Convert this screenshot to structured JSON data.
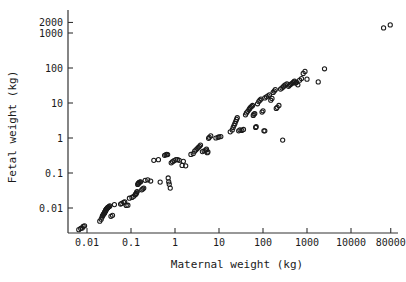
{
  "chart_data": {
    "type": "scatter",
    "title": "",
    "xlabel": "Maternal weight (kg)",
    "ylabel": "Fetal weight (kg)",
    "xscale": "log",
    "yscale": "log",
    "xlim": [
      0.005,
      100000
    ],
    "ylim": [
      0.0018,
      2600
    ],
    "grid": false,
    "legend": null,
    "marker": "open-circle",
    "marker_color": "#1a1a1a",
    "xticks": [
      0.01,
      0.1,
      1,
      10,
      100,
      1000,
      10000,
      80000
    ],
    "xticklabels": [
      "0.01",
      "0.1",
      "1",
      "10",
      "100",
      "1000",
      "10000",
      "80000"
    ],
    "yticks": [
      0.01,
      0.1,
      1,
      10,
      100,
      1000,
      2000
    ],
    "yticklabels": [
      "0.01",
      "0.1",
      "1",
      "10",
      "100",
      "1000",
      "2000"
    ],
    "series": [
      {
        "name": "mammals",
        "x": [
          0.0065,
          0.0072,
          0.0078,
          0.0082,
          0.0088,
          0.0195,
          0.021,
          0.022,
          0.0225,
          0.023,
          0.0235,
          0.024,
          0.0245,
          0.025,
          0.0252,
          0.0255,
          0.026,
          0.0262,
          0.0265,
          0.027,
          0.0272,
          0.0275,
          0.028,
          0.0285,
          0.029,
          0.0295,
          0.03,
          0.031,
          0.032,
          0.033,
          0.035,
          0.038,
          0.042,
          0.058,
          0.062,
          0.068,
          0.072,
          0.078,
          0.085,
          0.092,
          0.105,
          0.115,
          0.125,
          0.128,
          0.132,
          0.135,
          0.138,
          0.142,
          0.145,
          0.148,
          0.152,
          0.158,
          0.165,
          0.175,
          0.185,
          0.195,
          0.21,
          0.24,
          0.28,
          0.33,
          0.42,
          0.46,
          0.58,
          0.62,
          0.65,
          0.68,
          0.7,
          0.72,
          0.74,
          0.78,
          0.82,
          0.88,
          0.95,
          1.05,
          1.15,
          1.25,
          1.45,
          1.55,
          1.75,
          2.3,
          2.6,
          2.8,
          3.0,
          3.2,
          3.4,
          3.6,
          3.8,
          4.2,
          4.6,
          5.0,
          5.2,
          5.4,
          5.6,
          5.8,
          6.0,
          6.5,
          8.5,
          9.5,
          10.0,
          11.0,
          18.0,
          20.0,
          21.0,
          22.0,
          23.0,
          24.0,
          25.0,
          26.0,
          28.0,
          30.0,
          33.0,
          36.0,
          40.0,
          42.0,
          45.0,
          48.0,
          50.0,
          52.0,
          55.0,
          58.0,
          60.0,
          62.0,
          65.0,
          68.0,
          70.0,
          75.0,
          80.0,
          85.0,
          90.0,
          95.0,
          100.0,
          105.0,
          110.0,
          120.0,
          130.0,
          140.0,
          150.0,
          160.0,
          170.0,
          180.0,
          190.0,
          200.0,
          210.0,
          230.0,
          250.0,
          270.0,
          290.0,
          300.0,
          320.0,
          350.0,
          380.0,
          400.0,
          420.0,
          450.0,
          480.0,
          500.0,
          520.0,
          550.0,
          580.0,
          620.0,
          680.0,
          750.0,
          820.0,
          900.0,
          1000.0,
          1800.0,
          2500.0,
          280.0,
          110.0,
          55000.0,
          78000.0
        ],
        "y": [
          0.0024,
          0.0026,
          0.0027,
          0.003,
          0.0031,
          0.0042,
          0.0048,
          0.0055,
          0.006,
          0.0062,
          0.0065,
          0.0068,
          0.007,
          0.0072,
          0.0075,
          0.0078,
          0.008,
          0.0082,
          0.0085,
          0.0088,
          0.009,
          0.0092,
          0.0095,
          0.0098,
          0.01,
          0.0102,
          0.0105,
          0.0108,
          0.011,
          0.0115,
          0.0058,
          0.0062,
          0.0125,
          0.013,
          0.0135,
          0.0145,
          0.015,
          0.0118,
          0.012,
          0.019,
          0.02,
          0.0215,
          0.024,
          0.025,
          0.026,
          0.0285,
          0.0295,
          0.047,
          0.049,
          0.051,
          0.053,
          0.055,
          0.056,
          0.033,
          0.035,
          0.037,
          0.062,
          0.064,
          0.059,
          0.23,
          0.24,
          0.055,
          0.32,
          0.33,
          0.34,
          0.335,
          0.072,
          0.056,
          0.048,
          0.037,
          0.195,
          0.21,
          0.225,
          0.24,
          0.24,
          0.23,
          0.165,
          0.215,
          0.16,
          0.34,
          0.36,
          0.42,
          0.46,
          0.5,
          0.54,
          0.58,
          0.63,
          0.41,
          0.43,
          0.45,
          0.48,
          0.38,
          0.4,
          0.98,
          1.05,
          1.15,
          1.0,
          1.05,
          1.08,
          1.1,
          1.5,
          1.7,
          2.0,
          2.3,
          2.6,
          3.0,
          3.4,
          3.8,
          1.6,
          1.7,
          1.65,
          1.75,
          4.6,
          5.2,
          5.8,
          6.5,
          7.0,
          7.5,
          8.0,
          8.5,
          4.4,
          4.8,
          5.0,
          2.0,
          2.1,
          9.5,
          11.0,
          12.0,
          13.0,
          5.5,
          6.0,
          1.6,
          14.0,
          15.0,
          16.0,
          17.0,
          12.0,
          13.5,
          20.0,
          22.0,
          24.0,
          7.0,
          7.5,
          8.5,
          25.0,
          27.0,
          29.0,
          31.0,
          33.0,
          35.0,
          30.0,
          32.0,
          34.0,
          36.0,
          38.0,
          40.0,
          42.0,
          37.0,
          39.0,
          33.0,
          45.0,
          50.0,
          70.0,
          80.0,
          48.0,
          40.0,
          95.0,
          0.87,
          1.6,
          1400.0,
          1700.0
        ]
      }
    ]
  },
  "axes": {
    "x_title": "Maternal weight (kg)",
    "y_title": "Fetal weight (kg)"
  }
}
